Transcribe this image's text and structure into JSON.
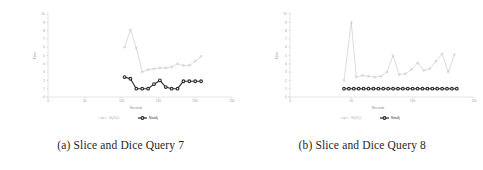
{
  "figure": {
    "subfigures": [
      {
        "caption": "(a) Slice and Dice Query 7",
        "chart_data": {
          "type": "line",
          "title": "",
          "xlabel": "Records",
          "ylabel": "Time",
          "xlim": [
            0,
            250
          ],
          "ylim": [
            0,
            10
          ],
          "xticks": [
            "0",
            "50",
            "100",
            "150",
            "200",
            "250"
          ],
          "xtick_values": [
            0,
            50,
            100,
            150,
            200,
            250
          ],
          "yticks": [
            "0",
            "1",
            "2",
            "3",
            "4",
            "5",
            "6",
            "7",
            "8",
            "9",
            "10"
          ],
          "ytick_values": [
            0,
            1,
            2,
            3,
            4,
            5,
            6,
            7,
            8,
            9,
            10
          ],
          "grid": false,
          "legend_position": "bottom",
          "series": [
            {
              "name": "MySQL",
              "color": "#b9b9b9",
              "marker": "circle-open",
              "x": [
                104,
                112,
                120,
                128,
                136,
                144,
                152,
                160,
                168,
                176,
                184,
                192,
                200,
                208
              ],
              "values": [
                6.0,
                8.1,
                5.9,
                3.0,
                3.3,
                3.4,
                3.5,
                3.5,
                3.6,
                4.0,
                3.8,
                3.8,
                4.3,
                4.9
              ]
            },
            {
              "name": "Neo4j",
              "color": "#2b2b2b",
              "marker": "circle-filled",
              "x": [
                104,
                112,
                120,
                128,
                136,
                144,
                152,
                160,
                168,
                176,
                184,
                192,
                200,
                208
              ],
              "values": [
                2.4,
                2.2,
                1.0,
                1.0,
                1.0,
                1.55,
                2.0,
                1.2,
                1.0,
                1.0,
                1.9,
                1.9,
                1.9,
                1.9
              ]
            }
          ]
        }
      },
      {
        "caption": "(b) Slice and Dice Query 8",
        "chart_data": {
          "type": "line",
          "title": "",
          "xlabel": "Records",
          "ylabel": "Time",
          "xlim": [
            0,
            150
          ],
          "ylim": [
            0,
            10
          ],
          "xticks": [
            "0",
            "50",
            "100",
            "150"
          ],
          "xtick_values": [
            0,
            50,
            100,
            150
          ],
          "yticks": [
            "0",
            "1",
            "2",
            "3",
            "4",
            "5",
            "6",
            "7",
            "8",
            "9",
            "10"
          ],
          "ytick_values": [
            0,
            1,
            2,
            3,
            4,
            5,
            6,
            7,
            8,
            9,
            10
          ],
          "grid": false,
          "legend_position": "bottom",
          "series": [
            {
              "name": "MySQL",
              "color": "#b9b9b9",
              "marker": "circle-open",
              "x": [
                44,
                50,
                54,
                59,
                64,
                69,
                74,
                79,
                84,
                89,
                94,
                99,
                104,
                109,
                114,
                119,
                124,
                129,
                134
              ],
              "values": [
                2.0,
                9.0,
                2.4,
                2.6,
                2.5,
                2.4,
                2.5,
                3.0,
                5.0,
                2.7,
                2.8,
                3.3,
                4.1,
                3.2,
                3.4,
                4.3,
                5.2,
                3.0,
                5.1
              ]
            },
            {
              "name": "Neo4j",
              "color": "#2b2b2b",
              "marker": "circle-filled",
              "x": [
                44,
                48,
                52,
                56,
                60,
                64,
                68,
                72,
                76,
                80,
                84,
                88,
                92,
                96,
                100,
                104,
                108,
                112,
                116,
                120,
                124,
                128,
                132,
                136
              ],
              "values": [
                1.0,
                1.0,
                1.0,
                1.0,
                1.0,
                1.0,
                1.0,
                1.0,
                1.0,
                1.0,
                1.0,
                1.0,
                1.0,
                1.0,
                1.0,
                1.0,
                1.0,
                1.0,
                1.0,
                1.0,
                1.0,
                1.0,
                1.0,
                1.0
              ]
            }
          ]
        }
      }
    ]
  }
}
